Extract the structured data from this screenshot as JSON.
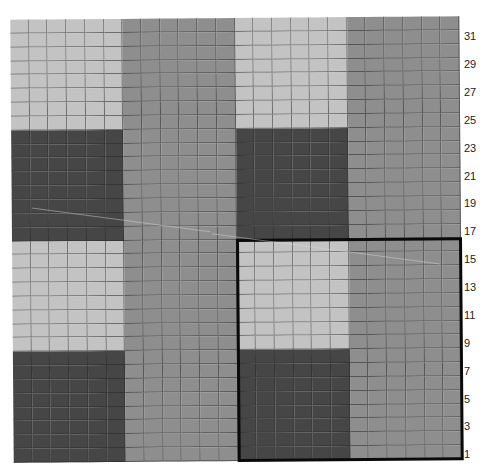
{
  "figure": {
    "grid": {
      "columns": 24,
      "rows": 32,
      "block_columns": 6,
      "block_rows": 8,
      "blocks": [
        [
          "light",
          "medium",
          "light",
          "medium"
        ],
        [
          "dark",
          "medium",
          "dark",
          "medium"
        ],
        [
          "light",
          "medium",
          "light",
          "medium"
        ],
        [
          "dark",
          "medium",
          "dark",
          "medium"
        ]
      ]
    },
    "colors": {
      "light": "#c3c3c3",
      "medium": "#8e8e8e",
      "dark": "#464646",
      "highlight_border": "#0a0a0a"
    },
    "highlight": {
      "col_start": 13,
      "col_end": 24,
      "row_start": 1,
      "row_end": 16
    },
    "row_labels": [
      "31",
      "29",
      "27",
      "25",
      "23",
      "21",
      "19",
      "17",
      "15",
      "13",
      "11",
      "9",
      "7",
      "5",
      "3",
      "1"
    ]
  }
}
